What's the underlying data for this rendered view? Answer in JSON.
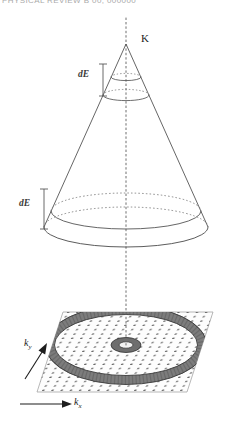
{
  "header": {
    "cropped_text": "PHYSICAL REVIEW B 00, 000000"
  },
  "figure": {
    "labels": {
      "apex": "K",
      "energy_window_upper": "dE",
      "energy_window_lower": "dE",
      "axis_y_symbol": "k",
      "axis_y_subscript": "y",
      "axis_x_symbol": "k",
      "axis_x_subscript": "x"
    },
    "colors": {
      "line": "#4a4a4a",
      "dotted_axis": "#6e6e6e",
      "ring_dark": "#808080",
      "ring_edge": "#3c3c3c",
      "plane_fill": "#fdfdfd",
      "plane_edge": "#9a9a9a",
      "grid_dot": "#2b2b2b",
      "label_text": "#1d1d1d",
      "header_text": "#8d8d8d"
    },
    "description": {
      "type": "dirac-cone-diagram",
      "cone_apex_y": 44,
      "cone_base_y": 226,
      "plane_center": [
        126,
        345
      ],
      "outer_ring_radius_x": 76,
      "inner_ring_radius_x": 15
    }
  }
}
